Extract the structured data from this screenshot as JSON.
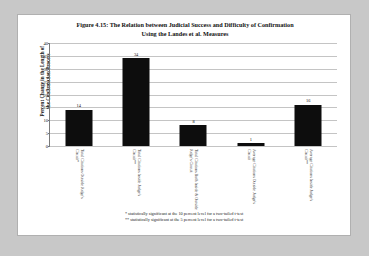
{
  "figure": {
    "title_line1": "Figure 4.15: The Relation between Judicial Success and Difficulty of Confirmation",
    "title_line2": "Using the Landes et al. Measures",
    "y_axis_title_line1": "Percent Change in the Length of",
    "y_axis_title_line2": "the Confirmation Process",
    "footnote_1": "* statistically significant at the 10 percent level for a two-tailed t-test",
    "footnote_2": "** statistically significant at the 5 percent level for a two-tailed t-test"
  },
  "chart_data": {
    "type": "bar",
    "title": "Figure 4.15: The Relation between Judicial Success and Difficulty of Confirmation Using the Landes et al. Measures",
    "xlabel": "",
    "ylabel": "Percent Change in the Length of the Confirmation Process",
    "ylim": [
      0,
      40
    ],
    "yticks": [
      0,
      5,
      10,
      15,
      20,
      25,
      30,
      35,
      40
    ],
    "ytick_labels": [
      "0",
      "5",
      "10",
      "15",
      "20",
      "25",
      "30",
      "35",
      "40"
    ],
    "grid": true,
    "legend": false,
    "bar_color": "#0d0d0d",
    "categories": [
      "Total Citations Outside Judge's Circuit*",
      "Total Citations Inside Judge's Circuit**",
      "Total Citations Both Inside & Outside Judge's Circuit",
      "Average Citations Outside Judge's Circuit",
      "Average Citations Inside Judge's Circuit**"
    ],
    "category_lines": [
      [
        "Total Citations Outside Judge's",
        "Circuit*"
      ],
      [
        "Total Citations Inside Judge's",
        "Circuit**"
      ],
      [
        "Total Citations Both Inside & Outside",
        "Judge's Circuit"
      ],
      [
        "Average Citations Outside Judge's",
        "Circuit"
      ],
      [
        "Average Citations Inside Judge's",
        "Circuit**"
      ]
    ],
    "values": [
      14,
      34,
      8,
      1,
      16
    ],
    "value_labels": [
      "14",
      "34",
      "8",
      "1",
      "16"
    ]
  }
}
